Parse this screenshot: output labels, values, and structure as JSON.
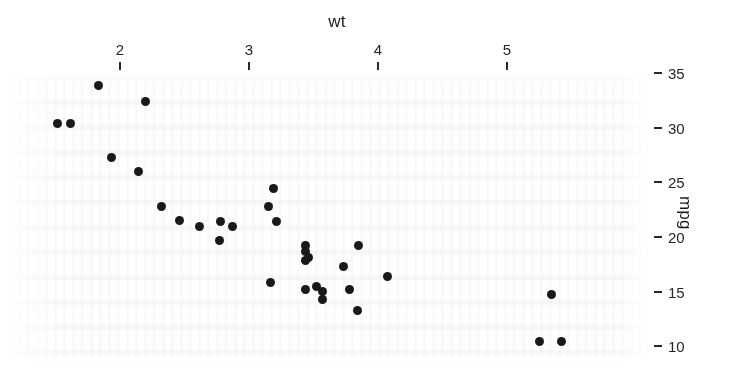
{
  "chart_data": {
    "type": "scatter",
    "title": "",
    "xlabel": "wt",
    "ylabel": "mpg",
    "xaxis_position": "top",
    "yaxis_position": "right",
    "grid": false,
    "legend": null,
    "xlim": [
      1.35,
      5.6
    ],
    "ylim": [
      9.0,
      35.5
    ],
    "xticks": [
      2,
      3,
      4,
      5
    ],
    "xticklabels": [
      "2",
      "3",
      "4",
      "5"
    ],
    "yticks": [
      35,
      30,
      25,
      20,
      15,
      10
    ],
    "yticklabels": [
      "35",
      "30",
      "25",
      "20",
      "15",
      "10"
    ],
    "marker": "filled-circle",
    "marker_color": "#191919",
    "marker_size": 9,
    "background_color": "#fefefe",
    "x": [
      2.62,
      2.875,
      2.32,
      3.215,
      3.44,
      3.46,
      3.57,
      3.19,
      3.15,
      3.44,
      3.44,
      4.07,
      3.73,
      3.78,
      5.25,
      5.424,
      5.345,
      2.2,
      1.615,
      1.835,
      2.465,
      3.52,
      3.435,
      3.84,
      3.845,
      1.935,
      2.14,
      1.513,
      3.17,
      2.77,
      3.57,
      2.78
    ],
    "y": [
      21.0,
      21.0,
      22.8,
      21.4,
      18.7,
      18.1,
      14.3,
      24.4,
      22.8,
      19.2,
      17.8,
      16.4,
      17.3,
      15.2,
      10.4,
      10.4,
      14.7,
      32.4,
      30.4,
      33.9,
      21.5,
      15.5,
      15.2,
      13.3,
      19.2,
      27.3,
      26.0,
      30.4,
      15.8,
      19.7,
      15.0,
      21.4
    ],
    "n_points": 32
  },
  "axes": {
    "x_title": "wt",
    "y_title": "mpg"
  }
}
